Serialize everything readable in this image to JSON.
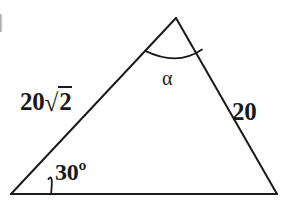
{
  "figure": {
    "type": "geometry-triangle-diagram",
    "background_color": "#ffffff",
    "stroke_color": "#1a1a1a",
    "stroke_width": 2,
    "vertices": {
      "apex": {
        "x": 176,
        "y": 18
      },
      "bottom_left": {
        "x": 11,
        "y": 194
      },
      "bottom_right": {
        "x": 277,
        "y": 194
      }
    },
    "labels": {
      "side_left": {
        "text": "20√2",
        "coefficient": "20",
        "radical_symbol": "√",
        "radicand": "2",
        "position": {
          "x": 19,
          "y": 89
        }
      },
      "side_right": {
        "text": "20",
        "position": {
          "x": 232,
          "y": 99
        }
      },
      "angle_base_left": {
        "text": "30º",
        "value": "30",
        "unit": "º",
        "position": {
          "x": 55,
          "y": 160
        }
      },
      "angle_apex": {
        "text": "α",
        "position": {
          "x": 162,
          "y": 68
        }
      }
    },
    "arcs": {
      "apex_arc": {
        "center_x": 176,
        "center_y": 18,
        "radius": 45
      },
      "base_left_arc": {
        "center_x": 11,
        "center_y": 194,
        "radius": 40
      }
    }
  }
}
